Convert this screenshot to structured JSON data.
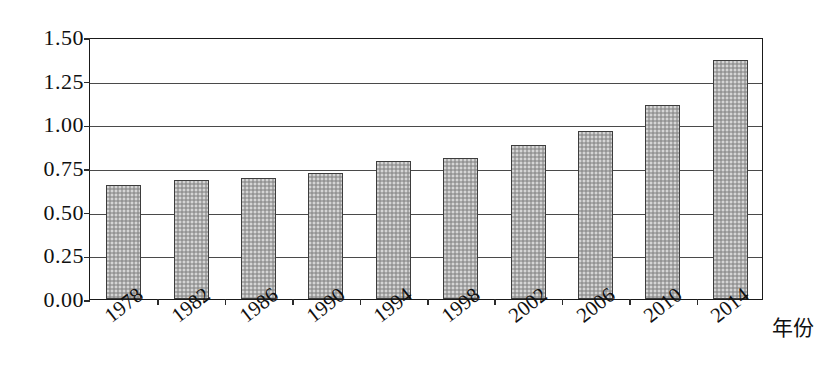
{
  "chart_data": {
    "type": "bar",
    "title": "",
    "subtitle": "",
    "xlabel": "年份",
    "ylabel": "",
    "categories": [
      "1978",
      "1982",
      "1986",
      "1990",
      "1994",
      "1998",
      "2002",
      "2006",
      "2010",
      "2014"
    ],
    "values": [
      0.65,
      0.68,
      0.69,
      0.72,
      0.79,
      0.81,
      0.88,
      0.96,
      1.11,
      1.37
    ],
    "series": [
      {
        "name": "",
        "values": [
          0.65,
          0.68,
          0.69,
          0.72,
          0.79,
          0.81,
          0.88,
          0.96,
          1.11,
          1.37
        ]
      }
    ],
    "ylim": [
      0.0,
      1.5
    ],
    "ytick_labels": [
      "0.00",
      "0.25",
      "0.50",
      "0.75",
      "1.00",
      "1.25",
      "1.50"
    ],
    "ytick_values": [
      0.0,
      0.25,
      0.5,
      0.75,
      1.0,
      1.25,
      1.5
    ],
    "grid": true,
    "grid_axis": "y",
    "legend": false,
    "legend_position": "none",
    "bar_fill_color": "#a9a9a9",
    "bar_border_color": "#3d3d3d",
    "axis_color": "#1a1a1a",
    "background_color": "#ffffff",
    "annotations": []
  }
}
